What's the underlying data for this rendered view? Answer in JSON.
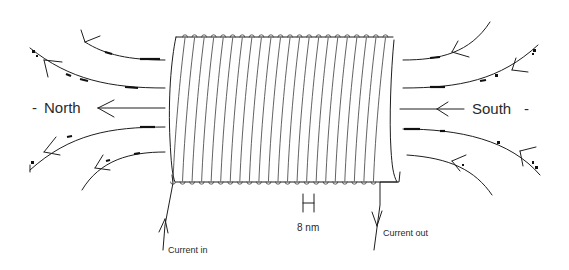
{
  "diagram": {
    "labels": {
      "north": "North",
      "south": "South",
      "current_in": "Current in",
      "current_out": "Current out",
      "pitch": "8 nm"
    },
    "pole_dash": "-",
    "colors": {
      "line": "#1e1e1e",
      "background": "#ffffff",
      "text": "#2a2a2a"
    },
    "coil": {
      "turns": 22,
      "left_x": 173,
      "right_x": 393,
      "top_y": 37,
      "bottom_y": 182
    }
  }
}
